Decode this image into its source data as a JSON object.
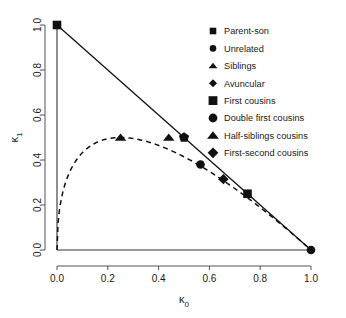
{
  "chart_data": {
    "type": "scatter",
    "title": "",
    "xlabel": "κ0",
    "ylabel": "κ1",
    "xlabel_base": "κ",
    "xlabel_sub": "0",
    "ylabel_base": "κ",
    "ylabel_sub": "1",
    "xlim": [
      0,
      1
    ],
    "ylim": [
      0,
      1
    ],
    "grid": false,
    "legend_position": "top-right",
    "xticks": [
      "0.0",
      "0.2",
      "0.4",
      "0.6",
      "0.8",
      "1.0"
    ],
    "xtick_values": [
      0.0,
      0.2,
      0.4,
      0.6,
      0.8,
      1.0
    ],
    "yticks": [
      "0.0",
      "0.2",
      "0.4",
      "0.6",
      "0.8",
      "1.0"
    ],
    "ytick_values": [
      0.0,
      0.2,
      0.4,
      0.6,
      0.8,
      1.0
    ],
    "points": [
      {
        "label": "Parent-son",
        "marker": "square",
        "size": "large",
        "x": 0.0,
        "y": 1.0
      },
      {
        "label": "Unrelated",
        "marker": "circle",
        "size": "large",
        "x": 1.0,
        "y": 0.0
      },
      {
        "label": "Siblings",
        "marker": "triangle",
        "size": "large",
        "x": 0.25,
        "y": 0.5
      },
      {
        "label": "Avuncular",
        "marker": "pentagon",
        "size": "large",
        "x": 0.5,
        "y": 0.5
      },
      {
        "label": "First cousins",
        "marker": "square",
        "size": "large",
        "x": 0.75,
        "y": 0.25
      },
      {
        "label": "Double first cousins",
        "marker": "circle",
        "size": "large",
        "x": 0.565,
        "y": 0.38
      },
      {
        "label": "Half-siblings cousins",
        "marker": "triangle",
        "size": "large",
        "x": 0.44,
        "y": 0.5
      },
      {
        "label": "First-second cousins",
        "marker": "diamond",
        "size": "large",
        "x": 0.655,
        "y": 0.315
      }
    ],
    "lines": [
      {
        "name": "boundary-line",
        "style": "solid",
        "from": [
          0,
          1
        ],
        "to": [
          1,
          0
        ]
      },
      {
        "name": "hw-curve",
        "style": "dashed",
        "equation": "k1 = 2*sqrt(k0) - 2*k0"
      }
    ],
    "legend": [
      {
        "label": "Parent-son",
        "marker": "square",
        "size": "small"
      },
      {
        "label": "Unrelated",
        "marker": "circle",
        "size": "small"
      },
      {
        "label": "Siblings",
        "marker": "triangle",
        "size": "small"
      },
      {
        "label": "Avuncular",
        "marker": "diamond",
        "size": "small"
      },
      {
        "label": " First cousins",
        "marker": "square",
        "size": "large"
      },
      {
        "label": "Double first cousins",
        "marker": "circle",
        "size": "large"
      },
      {
        "label": "Half-siblings cousins",
        "marker": "triangle",
        "size": "large"
      },
      {
        "label": "First-second cousins",
        "marker": "diamond",
        "size": "large"
      }
    ],
    "colors": {
      "marker": "#111111",
      "line": "#111111",
      "axis": "#333333",
      "text": "#1a1a1a",
      "background": "#ffffff"
    }
  }
}
